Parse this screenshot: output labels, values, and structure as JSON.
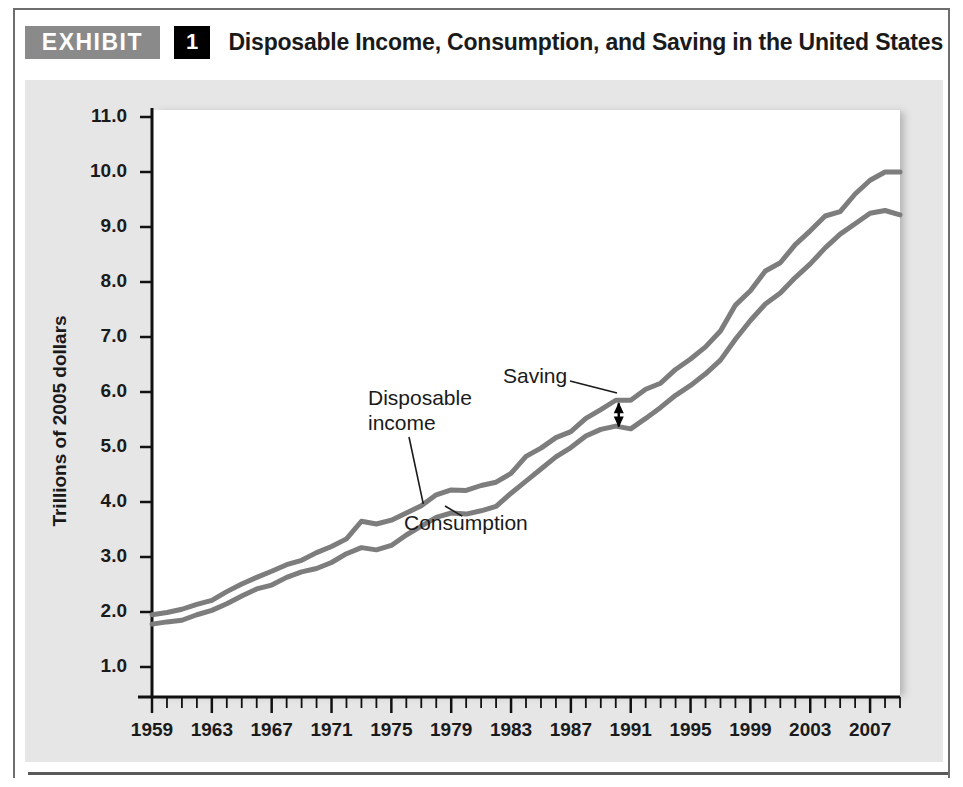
{
  "exhibit": {
    "badge_label": "EXHIBIT",
    "number": "1",
    "title": "Disposable Income, Consumption, and Saving in the United States"
  },
  "colors": {
    "line": "#7d7d7d",
    "panel": "#e6e6e6",
    "badge_gray": "#8a8a8a",
    "badge_black": "#000000",
    "axis": "#111111",
    "text": "#1a1a1a"
  },
  "chart_data": {
    "type": "line",
    "title": "Disposable Income, Consumption, and Saving in the United States",
    "xlabel": "",
    "ylabel": "Trillions of 2005 dollars",
    "xlim": [
      1959,
      2009
    ],
    "ylim": [
      0,
      11.5
    ],
    "yticks": [
      "11.0",
      "10.0",
      "9.0",
      "8.0",
      "7.0",
      "6.0",
      "5.0",
      "4.0",
      "3.0",
      "2.0",
      "1.0"
    ],
    "ytick_values": [
      11.0,
      10.0,
      9.0,
      8.0,
      7.0,
      6.0,
      5.0,
      4.0,
      3.0,
      2.0,
      1.0
    ],
    "xticks": [
      "1959",
      "1963",
      "1967",
      "1971",
      "1975",
      "1979",
      "1983",
      "1987",
      "1991",
      "1995",
      "1999",
      "2003",
      "2007"
    ],
    "xtick_values": [
      1959,
      1963,
      1967,
      1971,
      1975,
      1979,
      1983,
      1987,
      1991,
      1995,
      1999,
      2003,
      2007
    ],
    "minor_tick_interval": 1,
    "grid": false,
    "legend": "inline-annotations",
    "x": [
      1959,
      1960,
      1961,
      1962,
      1963,
      1964,
      1965,
      1966,
      1967,
      1968,
      1969,
      1970,
      1971,
      1972,
      1973,
      1974,
      1975,
      1976,
      1977,
      1978,
      1979,
      1980,
      1981,
      1982,
      1983,
      1984,
      1985,
      1986,
      1987,
      1988,
      1989,
      1990,
      1991,
      1992,
      1993,
      1994,
      1995,
      1996,
      1997,
      1998,
      1999,
      2000,
      2001,
      2002,
      2003,
      2004,
      2005,
      2006,
      2007,
      2008,
      2009
    ],
    "series": [
      {
        "name": "Disposable income",
        "values": [
          1.95,
          1.99,
          2.05,
          2.14,
          2.21,
          2.37,
          2.51,
          2.63,
          2.74,
          2.86,
          2.94,
          3.08,
          3.19,
          3.33,
          3.65,
          3.6,
          3.67,
          3.8,
          3.93,
          4.13,
          4.22,
          4.21,
          4.3,
          4.36,
          4.52,
          4.83,
          4.98,
          5.17,
          5.28,
          5.52,
          5.68,
          5.85,
          5.85,
          6.05,
          6.16,
          6.41,
          6.6,
          6.82,
          7.11,
          7.58,
          7.84,
          8.2,
          8.35,
          8.68,
          8.93,
          9.2,
          9.28,
          9.6,
          9.85,
          10.0,
          10.0
        ]
      },
      {
        "name": "Consumption",
        "values": [
          1.78,
          1.82,
          1.85,
          1.95,
          2.03,
          2.15,
          2.29,
          2.42,
          2.49,
          2.63,
          2.73,
          2.79,
          2.9,
          3.06,
          3.17,
          3.13,
          3.21,
          3.4,
          3.56,
          3.72,
          3.8,
          3.78,
          3.84,
          3.92,
          4.16,
          4.38,
          4.6,
          4.82,
          4.99,
          5.2,
          5.32,
          5.38,
          5.33,
          5.52,
          5.72,
          5.94,
          6.12,
          6.33,
          6.58,
          6.96,
          7.3,
          7.6,
          7.8,
          8.08,
          8.33,
          8.62,
          8.87,
          9.06,
          9.25,
          9.3,
          9.22
        ]
      }
    ],
    "annotations": [
      {
        "text": "Disposable income",
        "target_series": "Disposable income",
        "target_year": 1977
      },
      {
        "text": "Consumption",
        "target_series": "Consumption",
        "target_year": 1980
      },
      {
        "text": "Saving",
        "target_year": 1990,
        "marker": "double-headed-arrow",
        "span_top": 5.85,
        "span_bottom": 5.32
      }
    ]
  },
  "labels": {
    "disposable_income_line1": "Disposable",
    "disposable_income_line2": "income",
    "consumption": "Consumption",
    "saving": "Saving"
  }
}
